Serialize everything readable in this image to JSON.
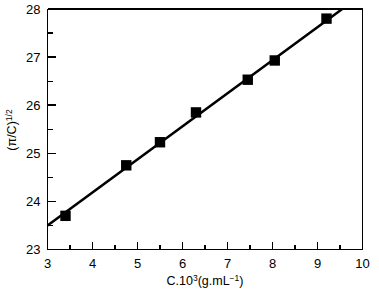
{
  "chart_data": {
    "type": "scatter",
    "title": "",
    "subtitle": "",
    "xlabel": "C.10³(g.mL⁻¹)",
    "ylabel": "(π/C)¹ᐟ²",
    "ylabel_parts": {
      "base": "(π/C)",
      "exponent": "1/2"
    },
    "xlabel_parts": {
      "prefix": "C.10",
      "prefix_exponent": "3",
      "middle": "(g.mL",
      "middle_exponent": "−1",
      "suffix": ")"
    },
    "xlim": [
      3,
      10
    ],
    "ylim": [
      23,
      28
    ],
    "xticks": [
      3,
      4,
      5,
      6,
      7,
      8,
      9,
      10
    ],
    "xticklabels": [
      "3",
      "4",
      "5",
      "6",
      "7",
      "8",
      "9",
      "10"
    ],
    "yticks": [
      23,
      24,
      25,
      26,
      27,
      28
    ],
    "yticklabels": [
      "23",
      "24",
      "25",
      "26",
      "27",
      "28"
    ],
    "x_minor_ticks": [
      3.5,
      4.5,
      5.5,
      6.5,
      7.5,
      8.5,
      9.5
    ],
    "y_minor_ticks": [
      23.5,
      24.5,
      25.5,
      26.5,
      27.5
    ],
    "grid": false,
    "legend": false,
    "legend_position": "none",
    "marker_style": "filled-square",
    "marker_color": "#000000",
    "line_color": "#000000",
    "series": [
      {
        "name": "measured",
        "marker": "filled-square",
        "x": [
          3.4,
          4.75,
          5.5,
          6.3,
          7.45,
          8.05,
          9.2
        ],
        "y": [
          23.7,
          24.75,
          25.23,
          25.85,
          26.53,
          26.93,
          27.8
        ]
      }
    ],
    "fit_line": {
      "name": "linear-fit",
      "x_start": 3.0,
      "y_start": 23.5,
      "x_end": 9.55,
      "y_end": 28.0
    }
  }
}
